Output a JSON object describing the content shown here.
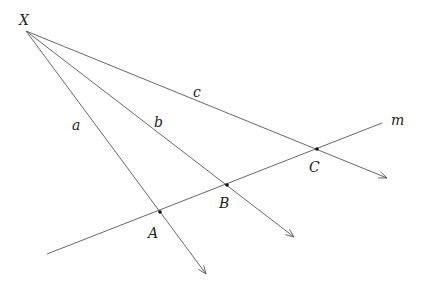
{
  "diagram": {
    "type": "geometry",
    "colors": {
      "line": "#555555",
      "point": "#111111",
      "text": "#222222"
    },
    "origin": {
      "label": "X",
      "x": 26,
      "y": 31,
      "label_x": 19,
      "label_y": 25
    },
    "rays": [
      {
        "name": "a",
        "end_x": 206,
        "end_y": 274,
        "label_x": 72,
        "label_y": 130
      },
      {
        "name": "b",
        "end_x": 294,
        "end_y": 237,
        "label_x": 154,
        "label_y": 127
      },
      {
        "name": "c",
        "end_x": 387,
        "end_y": 178,
        "label_x": 193,
        "label_y": 97
      }
    ],
    "transversal": {
      "name": "m",
      "x1": 47,
      "y1": 254,
      "x2": 382,
      "y2": 123,
      "label_x": 391,
      "label_y": 125
    },
    "points": [
      {
        "label": "A",
        "x": 160,
        "y": 212,
        "label_x": 148,
        "label_y": 238
      },
      {
        "label": "B",
        "x": 227,
        "y": 185,
        "label_x": 219,
        "label_y": 208
      },
      {
        "label": "C",
        "x": 317,
        "y": 149,
        "label_x": 309,
        "label_y": 172
      }
    ]
  }
}
